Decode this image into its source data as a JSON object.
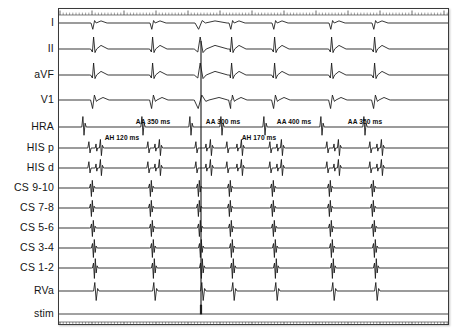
{
  "recording": {
    "kind": "intracardiac-electrophysiology-study",
    "frame": {
      "x": 58,
      "y": 8,
      "width": 391,
      "height": 317
    },
    "ink_color": "#141414",
    "frame_color": "#3a3a3a",
    "background": "#ffffff"
  },
  "channels": [
    {
      "id": "I",
      "label": "I",
      "y": 22,
      "group": "surface-ecg",
      "baseline": 22,
      "amplitude": 7
    },
    {
      "id": "II",
      "label": "II",
      "y": 48,
      "group": "surface-ecg",
      "baseline": 48,
      "amplitude": 12
    },
    {
      "id": "aVF",
      "label": "aVF",
      "y": 74,
      "group": "surface-ecg",
      "baseline": 74,
      "amplitude": 12
    },
    {
      "id": "V1",
      "label": "V1",
      "y": 99,
      "group": "surface-ecg",
      "baseline": 99,
      "amplitude": 9
    },
    {
      "id": "HRA",
      "label": "HRA",
      "y": 126,
      "group": "intracardiac",
      "baseline": 126,
      "amplitude": 11
    },
    {
      "id": "HISp",
      "label": "HIS p",
      "y": 147,
      "group": "intracardiac",
      "baseline": 147,
      "amplitude": 9
    },
    {
      "id": "HISd",
      "label": "HIS d",
      "y": 167,
      "group": "intracardiac",
      "baseline": 167,
      "amplitude": 9
    },
    {
      "id": "CS910",
      "label": "CS 9-10",
      "y": 187,
      "group": "coronary-sinus",
      "baseline": 187,
      "amplitude": 9
    },
    {
      "id": "CS78",
      "label": "CS 7-8",
      "y": 207,
      "group": "coronary-sinus",
      "baseline": 207,
      "amplitude": 9
    },
    {
      "id": "CS56",
      "label": "CS 5-6",
      "y": 227,
      "group": "coronary-sinus",
      "baseline": 227,
      "amplitude": 9
    },
    {
      "id": "CS34",
      "label": "CS 3-4",
      "y": 247,
      "group": "coronary-sinus",
      "baseline": 247,
      "amplitude": 10
    },
    {
      "id": "CS12",
      "label": "CS 1-2",
      "y": 267,
      "group": "coronary-sinus",
      "baseline": 267,
      "amplitude": 11
    },
    {
      "id": "RVa",
      "label": "RVa",
      "y": 290,
      "group": "intracardiac",
      "baseline": 290,
      "amplitude": 10
    },
    {
      "id": "stim",
      "label": "stim",
      "y": 313,
      "group": "stimulus",
      "baseline": 313,
      "amplitude": 7
    }
  ],
  "annotations": [
    {
      "id": "aa-1",
      "text": "AA 350 ms",
      "x": 152,
      "y": 120,
      "measure": "AA",
      "value": 350,
      "unit": "ms"
    },
    {
      "id": "aa-2",
      "text": "AA 300 ms",
      "x": 222,
      "y": 120,
      "measure": "AA",
      "value": 300,
      "unit": "ms"
    },
    {
      "id": "aa-3",
      "text": "AA 400 ms",
      "x": 293,
      "y": 120,
      "measure": "AA",
      "value": 400,
      "unit": "ms"
    },
    {
      "id": "aa-4",
      "text": "AA 350 ms",
      "x": 364,
      "y": 120,
      "measure": "AA",
      "value": 350,
      "unit": "ms"
    },
    {
      "id": "ah-1",
      "text": "AH 120 ms",
      "x": 121,
      "y": 136,
      "measure": "AH",
      "value": 120,
      "unit": "ms"
    },
    {
      "id": "ah-2",
      "text": "AH 170 ms",
      "x": 258,
      "y": 136,
      "measure": "AH",
      "value": 170,
      "unit": "ms"
    }
  ],
  "chart_data": {
    "type": "line",
    "title": "",
    "xlabel": "",
    "ylabel": "",
    "grid": false,
    "legend": "none",
    "time_axis": {
      "ruler_top": true,
      "ruler_bottom": true,
      "tick_spacing_px": 3.2,
      "major_tick_every": 10
    },
    "beat_times_px": [
      22,
      93,
      152,
      200,
      231,
      274,
      331,
      374
    ],
    "premature_beat_px": 200,
    "series": [
      {
        "name": "I",
        "beat_shape": "small-qrs",
        "values": [
          22,
          93,
          152,
          200,
          231,
          274,
          331,
          374
        ]
      },
      {
        "name": "II",
        "beat_shape": "tall-qrs",
        "values": [
          22,
          93,
          152,
          200,
          231,
          274,
          331,
          374
        ]
      },
      {
        "name": "aVF",
        "beat_shape": "tall-qrs",
        "values": [
          22,
          93,
          152,
          200,
          231,
          274,
          331,
          374
        ]
      },
      {
        "name": "V1",
        "beat_shape": "biphasic-qrs",
        "values": [
          22,
          93,
          152,
          200,
          231,
          274,
          331,
          374
        ]
      },
      {
        "name": "HRA",
        "beat_shape": "atrial-spike",
        "values": [
          12,
          83,
          142,
          190,
          221,
          264,
          321,
          364
        ]
      },
      {
        "name": "HIS p",
        "beat_shape": "a-h-v-complex",
        "values": [
          18,
          89,
          148,
          196,
          227,
          270,
          327,
          370
        ]
      },
      {
        "name": "HIS d",
        "beat_shape": "a-h-v-complex",
        "values": [
          18,
          89,
          148,
          196,
          227,
          270,
          327,
          370
        ]
      },
      {
        "name": "CS 9-10",
        "beat_shape": "cs-bipolar",
        "values": [
          20,
          91,
          150,
          198,
          229,
          272,
          329,
          372
        ]
      },
      {
        "name": "CS 7-8",
        "beat_shape": "cs-bipolar",
        "values": [
          20,
          91,
          150,
          198,
          229,
          272,
          329,
          372
        ]
      },
      {
        "name": "CS 5-6",
        "beat_shape": "cs-bipolar",
        "values": [
          21,
          92,
          151,
          199,
          230,
          273,
          330,
          373
        ]
      },
      {
        "name": "CS 3-4",
        "beat_shape": "cs-bipolar",
        "values": [
          22,
          93,
          152,
          200,
          231,
          274,
          331,
          374
        ]
      },
      {
        "name": "CS 1-2",
        "beat_shape": "cs-bipolar",
        "values": [
          23,
          94,
          153,
          201,
          232,
          275,
          332,
          375
        ]
      },
      {
        "name": "RVa",
        "beat_shape": "ventricular",
        "values": [
          24,
          95,
          154,
          202,
          233,
          276,
          333,
          376
        ]
      },
      {
        "name": "stim",
        "beat_shape": "stim-marker",
        "values": [
          200
        ]
      }
    ]
  }
}
